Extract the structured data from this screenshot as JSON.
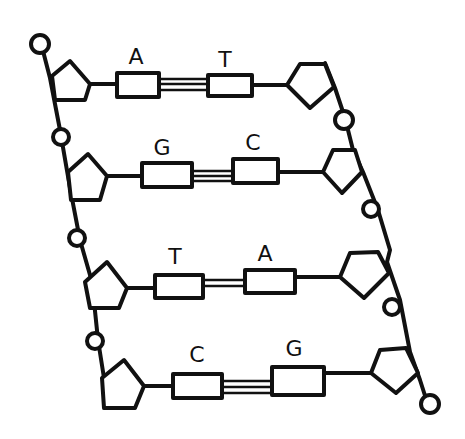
{
  "diagram": {
    "pairs": [
      {
        "left": "A",
        "right": "T",
        "bonds": 2
      },
      {
        "left": "G",
        "right": "C",
        "bonds": 3
      },
      {
        "left": "T",
        "right": "A",
        "bonds": 2
      },
      {
        "left": "C",
        "right": "G",
        "bonds": 3
      }
    ],
    "components": {
      "phosphate": "circle",
      "sugar": "pentagon",
      "base": "rectangle",
      "hydrogen_bond": "parallel-lines"
    },
    "colors": {
      "line": "#111111",
      "background": "#ffffff"
    }
  }
}
